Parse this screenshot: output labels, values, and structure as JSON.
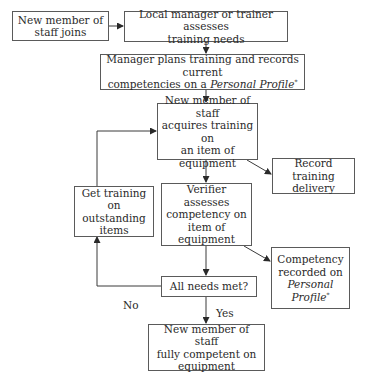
{
  "diagram": {
    "type": "flowchart",
    "nodes": {
      "new_member_joins": {
        "lines": [
          "New member of",
          "staff joins"
        ]
      },
      "assess_needs": {
        "lines": [
          "Local manager or trainer assesses",
          "training needs"
        ]
      },
      "plan_training": {
        "line1": "Manager plans training and records current",
        "line2_prefix": "competencies on a ",
        "line2_italic": "Personal Profile",
        "marker": "*"
      },
      "acquire_training": {
        "lines": [
          "New member of staff",
          "acquires training on",
          "an item of",
          "equipment"
        ]
      },
      "record_training": {
        "lines": [
          "Record training",
          "delivery"
        ]
      },
      "get_training": {
        "lines": [
          "Get training on",
          "outstanding",
          "items"
        ]
      },
      "verifier_assesses": {
        "lines": [
          "Verifier assesses",
          "competency on",
          "item of",
          "equipment"
        ]
      },
      "competency_recorded": {
        "line1": "Competency",
        "line2": "recorded on",
        "line3_italic": "Personal",
        "line4_italic": "Profile",
        "marker": "*"
      },
      "all_needs_met": {
        "lines": [
          "All needs met?"
        ]
      },
      "fully_competent": {
        "lines": [
          "New member of staff",
          "fully competent on",
          "equipment"
        ]
      }
    },
    "edge_labels": {
      "no": "No",
      "yes": "Yes"
    },
    "edges": [
      {
        "from": "new_member_joins",
        "to": "assess_needs"
      },
      {
        "from": "assess_needs",
        "to": "plan_training"
      },
      {
        "from": "plan_training",
        "to": "acquire_training"
      },
      {
        "from": "acquire_training",
        "to": "record_training"
      },
      {
        "from": "acquire_training",
        "to": "verifier_assesses"
      },
      {
        "from": "verifier_assesses",
        "to": "competency_recorded"
      },
      {
        "from": "verifier_assesses",
        "to": "all_needs_met"
      },
      {
        "from": "all_needs_met",
        "to": "get_training",
        "label": "No"
      },
      {
        "from": "get_training",
        "to": "acquire_training"
      },
      {
        "from": "all_needs_met",
        "to": "fully_competent",
        "label": "Yes"
      }
    ],
    "colors": {
      "line": "#3a3a3a",
      "text": "#2a2a2a",
      "border": "#5a5a5a",
      "background": "#ffffff"
    }
  }
}
